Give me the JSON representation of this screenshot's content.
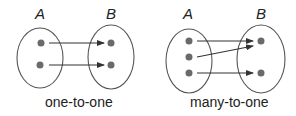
{
  "diagrams": [
    {
      "name": "one-to-one",
      "caption": "one-to-one",
      "domain_label": "A",
      "codomain_label": "B",
      "domain_elements": 2,
      "codomain_elements": 2,
      "mappings": [
        [
          0,
          0
        ],
        [
          1,
          1
        ]
      ]
    },
    {
      "name": "many-to-one",
      "caption": "many-to-one",
      "domain_label": "A",
      "codomain_label": "B",
      "domain_elements": 3,
      "codomain_elements": 2,
      "mappings": [
        [
          0,
          0
        ],
        [
          1,
          0
        ],
        [
          2,
          1
        ]
      ]
    }
  ],
  "colors": {
    "ellipse_stroke": "#555555",
    "dot_fill": "#6a6a6a",
    "arrow": "#333333",
    "text": "#222222"
  }
}
